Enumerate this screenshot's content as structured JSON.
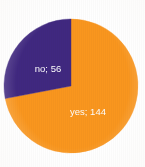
{
  "chart_data": {
    "type": "pie",
    "title": "",
    "subtitle": "",
    "xlabel": "",
    "ylabel": "",
    "legend_position": "none",
    "grid": false,
    "total": 200,
    "categories": [
      "yes",
      "no"
    ],
    "values": [
      144,
      56
    ],
    "percentages": [
      72,
      28
    ],
    "slices": [
      {
        "name": "yes",
        "value": 144,
        "label": "yes; 144",
        "percent": 72,
        "angle_deg": 259.2,
        "start_angle_deg": 0,
        "end_angle_deg": 259.2,
        "color": "#f9961e",
        "label_color": "#fdfdfd",
        "label_x": 88,
        "label_y": 112
      },
      {
        "name": "no",
        "value": 56,
        "label": "no; 56",
        "percent": 28,
        "angle_deg": 100.8,
        "start_angle_deg": 259.2,
        "end_angle_deg": 360,
        "color": "#402880",
        "label_color": "#fdfdfd",
        "label_x": 48,
        "label_y": 69
      }
    ],
    "geometry": {
      "center_x": 71,
      "center_y": 86,
      "radius": 67
    },
    "background_color": "#ffffff"
  }
}
